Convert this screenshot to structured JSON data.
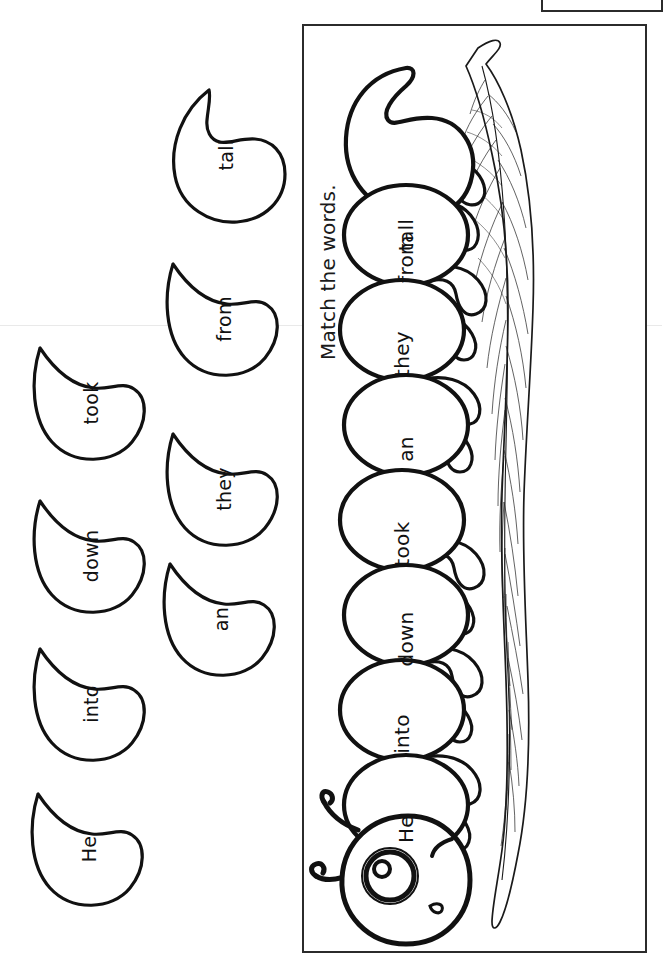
{
  "worksheet": {
    "instruction": "Match the words.",
    "ink_color": "#1a1a1a",
    "background_color": "#ffffff"
  },
  "caterpillar": {
    "name": "caterpillar-on-leaf",
    "segments": [
      {
        "label": "tall"
      },
      {
        "label": "from"
      },
      {
        "label": "they"
      },
      {
        "label": "an"
      },
      {
        "label": "took"
      },
      {
        "label": "down"
      },
      {
        "label": "into"
      },
      {
        "label": "He"
      }
    ]
  },
  "cutouts": [
    {
      "label": "tall"
    },
    {
      "label": "from"
    },
    {
      "label": "took"
    },
    {
      "label": "they"
    },
    {
      "label": "down"
    },
    {
      "label": "an"
    },
    {
      "label": "into"
    },
    {
      "label": "He"
    }
  ]
}
